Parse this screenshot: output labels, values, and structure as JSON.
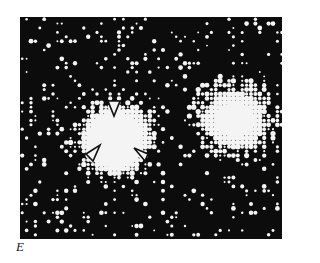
{
  "figure": {
    "panel_label": "E",
    "image": {
      "description": "Halftone dot-matrix image with a bright central blob (marked by three arrowheads) and a diffuse bright cloud on the right, over a dark background with scattered dots",
      "background_color": "#0c0c0c",
      "dot_color": "#f4f4f4",
      "grid_spacing_px": 4.4,
      "bright_regions": [
        {
          "name": "central-blob",
          "cx": 95,
          "cy": 123,
          "rx": 38,
          "ry": 40,
          "strength": 1.35
        },
        {
          "name": "right-cloud",
          "cx": 215,
          "cy": 103,
          "rx": 44,
          "ry": 42,
          "strength": 1.0
        }
      ],
      "arrowheads": [
        {
          "name": "arrowhead-top",
          "points": "88,84 100,84 94,99",
          "direction": "down"
        },
        {
          "name": "arrowhead-lower-left",
          "points": "66,137 80,128 73,144",
          "direction": "down-left"
        },
        {
          "name": "arrowhead-lower-right",
          "points": "114,131 128,137 125,144",
          "direction": "down-right"
        }
      ]
    }
  }
}
